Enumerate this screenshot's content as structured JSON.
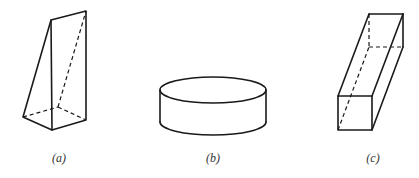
{
  "figures": [
    {
      "id": "a",
      "label": "(a)",
      "shape": "wedge-prism"
    },
    {
      "id": "b",
      "label": "(b)",
      "shape": "cylinder"
    },
    {
      "id": "c",
      "label": "(c)",
      "shape": "rectangular-prism"
    }
  ],
  "colors": {
    "stroke": "#1a1a1a",
    "label": "#333333",
    "background": "#ffffff"
  }
}
